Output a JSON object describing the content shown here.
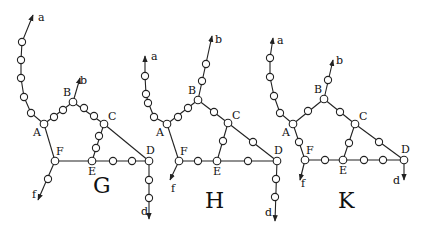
{
  "panels": [
    {
      "id": "G",
      "title": "G",
      "title_pos": [
        93,
        193
      ],
      "vertices": {
        "A": [
          44,
          124
        ],
        "B": [
          73,
          102
        ],
        "C": [
          104,
          124
        ],
        "D": [
          149,
          161
        ],
        "E": [
          92,
          161
        ],
        "F": [
          55,
          161
        ]
      },
      "ends": {
        "a": {
          "at": [
            33,
            15
          ],
          "label_pos": [
            38,
            21
          ]
        },
        "b": {
          "at": [
            80,
            78
          ],
          "label_pos": [
            80,
            84
          ]
        },
        "f": {
          "at": [
            38,
            200
          ],
          "label_pos": [
            32,
            198
          ]
        },
        "d": {
          "at": [
            149,
            219
          ],
          "label_pos": [
            141,
            215
          ]
        }
      },
      "chains": [
        {
          "from": "A",
          "to": "a",
          "path": [
            [
              44,
              124
            ],
            [
              31,
              113
            ],
            [
              24,
              97
            ],
            [
              21,
              78
            ],
            [
              21,
              60
            ],
            [
              22,
              42
            ],
            [
              33,
              15
            ]
          ],
          "beads": [
            [
              31,
              113
            ],
            [
              24,
              97
            ],
            [
              21,
              78
            ],
            [
              21,
              60
            ],
            [
              22,
              42
            ]
          ]
        },
        {
          "from": "A",
          "to": "B",
          "path": [
            [
              44,
              124
            ],
            [
              73,
              102
            ]
          ],
          "beads": [
            [
              54,
              117
            ],
            [
              63,
              110
            ]
          ]
        },
        {
          "from": "B",
          "to": "b",
          "path": [
            [
              73,
              102
            ],
            [
              80,
              78
            ]
          ],
          "beads": []
        },
        {
          "from": "B",
          "to": "C",
          "path": [
            [
              73,
              102
            ],
            [
              104,
              124
            ]
          ],
          "beads": [
            [
              84,
              108
            ],
            [
              94,
              116
            ]
          ]
        },
        {
          "from": "C",
          "to": "E",
          "path": [
            [
              104,
              124
            ],
            [
              92,
              161
            ]
          ],
          "beads": [
            [
              99,
              136
            ],
            [
              96,
              148
            ]
          ]
        },
        {
          "from": "C",
          "to": "D",
          "path": [
            [
              104,
              124
            ],
            [
              149,
              161
            ]
          ],
          "beads": []
        },
        {
          "from": "A",
          "to": "F",
          "path": [
            [
              44,
              124
            ],
            [
              55,
              161
            ]
          ],
          "beads": []
        },
        {
          "from": "F",
          "to": "E",
          "path": [
            [
              55,
              161
            ],
            [
              92,
              161
            ]
          ],
          "beads": []
        },
        {
          "from": "E",
          "to": "D",
          "path": [
            [
              92,
              161
            ],
            [
              149,
              161
            ]
          ],
          "beads": [
            [
              113,
              161
            ],
            [
              132,
              161
            ]
          ]
        },
        {
          "from": "F",
          "to": "f",
          "path": [
            [
              55,
              161
            ],
            [
              38,
              200
            ]
          ],
          "beads": [
            [
              48,
              179
            ]
          ]
        },
        {
          "from": "D",
          "to": "d",
          "path": [
            [
              149,
              161
            ],
            [
              149,
              219
            ]
          ],
          "beads": [
            [
              149,
              180
            ],
            [
              149,
              198
            ]
          ]
        }
      ]
    },
    {
      "id": "H",
      "title": "H",
      "title_pos": [
        205,
        208
      ],
      "vertices": {
        "A": [
          167,
          124
        ],
        "B": [
          198,
          100
        ],
        "C": [
          228,
          123
        ],
        "D": [
          277,
          161
        ],
        "E": [
          217,
          161
        ],
        "F": [
          179,
          161
        ]
      },
      "ends": {
        "a": {
          "at": [
            145,
            56
          ],
          "label_pos": [
            151,
            60
          ]
        },
        "b": {
          "at": [
            212,
            36
          ],
          "label_pos": [
            215,
            43
          ]
        },
        "f": {
          "at": [
            170,
            180
          ],
          "label_pos": [
            171,
            192
          ]
        },
        "d": {
          "at": [
            275,
            221
          ],
          "label_pos": [
            265,
            216
          ]
        }
      },
      "chains": [
        {
          "from": "A",
          "to": "a",
          "path": [
            [
              167,
              124
            ],
            [
              154,
              117
            ],
            [
              148,
              102
            ],
            [
              146,
              94
            ],
            [
              145,
              76
            ],
            [
              145,
              56
            ]
          ],
          "beads": [
            [
              154,
              117
            ],
            [
              148,
              103
            ],
            [
              146,
              94
            ],
            [
              145,
              76
            ]
          ]
        },
        {
          "from": "A",
          "to": "B",
          "path": [
            [
              167,
              124
            ],
            [
              198,
              100
            ]
          ],
          "beads": [
            [
              178,
              117
            ],
            [
              188,
              108
            ]
          ]
        },
        {
          "from": "B",
          "to": "b",
          "path": [
            [
              198,
              100
            ],
            [
              212,
              36
            ]
          ],
          "beads": [
            [
              202,
              81
            ],
            [
              206,
              64
            ]
          ]
        },
        {
          "from": "B",
          "to": "C",
          "path": [
            [
              198,
              100
            ],
            [
              228,
              123
            ]
          ],
          "beads": [
            [
              214,
              112
            ]
          ]
        },
        {
          "from": "C",
          "to": "E",
          "path": [
            [
              228,
              123
            ],
            [
              217,
              161
            ]
          ],
          "beads": [
            [
              223,
              141
            ]
          ]
        },
        {
          "from": "C",
          "to": "D",
          "path": [
            [
              228,
              123
            ],
            [
              277,
              161
            ]
          ],
          "beads": [
            [
              253,
              142
            ]
          ]
        },
        {
          "from": "A",
          "to": "F",
          "path": [
            [
              167,
              124
            ],
            [
              179,
              161
            ]
          ],
          "beads": []
        },
        {
          "from": "F",
          "to": "E",
          "path": [
            [
              179,
              161
            ],
            [
              217,
              161
            ]
          ],
          "beads": [
            [
              198,
              161
            ]
          ]
        },
        {
          "from": "E",
          "to": "D",
          "path": [
            [
              217,
              161
            ],
            [
              277,
              161
            ]
          ],
          "beads": [
            [
              248,
              161
            ]
          ]
        },
        {
          "from": "F",
          "to": "f",
          "path": [
            [
              179,
              161
            ],
            [
              170,
              180
            ]
          ],
          "beads": []
        },
        {
          "from": "D",
          "to": "d",
          "path": [
            [
              277,
              161
            ],
            [
              275,
              221
            ]
          ],
          "beads": [
            [
              276,
              179
            ],
            [
              275,
              197
            ]
          ]
        }
      ]
    },
    {
      "id": "K",
      "title": "K",
      "title_pos": [
        338,
        208
      ],
      "vertices": {
        "A": [
          293,
          124
        ],
        "B": [
          324,
          99
        ],
        "C": [
          355,
          124
        ],
        "D": [
          404,
          160
        ],
        "E": [
          343,
          160
        ],
        "F": [
          305,
          160
        ]
      },
      "ends": {
        "a": {
          "at": [
            273,
            38
          ],
          "label_pos": [
            277,
            44
          ]
        },
        "b": {
          "at": [
            333,
            60
          ],
          "label_pos": [
            336,
            64
          ]
        },
        "f": {
          "at": [
            300,
            180
          ],
          "label_pos": [
            301,
            187
          ]
        },
        "d": {
          "at": [
            404,
            180
          ],
          "label_pos": [
            393,
            184
          ]
        }
      },
      "chains": [
        {
          "from": "A",
          "to": "a",
          "path": [
            [
              293,
              124
            ],
            [
              280,
              113
            ],
            [
              274,
              96
            ],
            [
              270,
              77
            ],
            [
              270,
              58
            ],
            [
              273,
              38
            ]
          ],
          "beads": [
            [
              280,
              113
            ],
            [
              274,
              96
            ],
            [
              270,
              77
            ],
            [
              270,
              58
            ]
          ]
        },
        {
          "from": "A",
          "to": "B",
          "path": [
            [
              293,
              124
            ],
            [
              324,
              99
            ]
          ],
          "beads": [
            [
              308,
              111
            ]
          ]
        },
        {
          "from": "B",
          "to": "b",
          "path": [
            [
              324,
              99
            ],
            [
              333,
              60
            ]
          ],
          "beads": [
            [
              328,
              80
            ]
          ]
        },
        {
          "from": "B",
          "to": "C",
          "path": [
            [
              324,
              99
            ],
            [
              355,
              124
            ]
          ],
          "beads": [
            [
              340,
              112
            ]
          ]
        },
        {
          "from": "C",
          "to": "E",
          "path": [
            [
              355,
              124
            ],
            [
              343,
              160
            ]
          ],
          "beads": [
            [
              349,
              143
            ]
          ]
        },
        {
          "from": "C",
          "to": "D",
          "path": [
            [
              355,
              124
            ],
            [
              404,
              160
            ]
          ],
          "beads": [
            [
              379,
              142
            ]
          ]
        },
        {
          "from": "A",
          "to": "F",
          "path": [
            [
              293,
              124
            ],
            [
              305,
              160
            ]
          ],
          "beads": [
            [
              299,
              142
            ]
          ]
        },
        {
          "from": "F",
          "to": "E",
          "path": [
            [
              305,
              160
            ],
            [
              343,
              160
            ]
          ],
          "beads": [
            [
              325,
              160
            ]
          ]
        },
        {
          "from": "E",
          "to": "D",
          "path": [
            [
              343,
              160
            ],
            [
              404,
              160
            ]
          ],
          "beads": [
            [
              364,
              160
            ],
            [
              383,
              160
            ]
          ]
        },
        {
          "from": "F",
          "to": "f",
          "path": [
            [
              305,
              160
            ],
            [
              300,
              180
            ]
          ],
          "beads": []
        },
        {
          "from": "D",
          "to": "d",
          "path": [
            [
              404,
              160
            ],
            [
              404,
              180
            ]
          ],
          "beads": []
        }
      ]
    }
  ],
  "vertex_label_offsets": {
    "A": [
      -11,
      12
    ],
    "B": [
      -10,
      -6
    ],
    "C": [
      4,
      -4
    ],
    "D": [
      -3,
      -7
    ],
    "E": [
      -4,
      14
    ],
    "F": [
      1,
      -6
    ]
  }
}
